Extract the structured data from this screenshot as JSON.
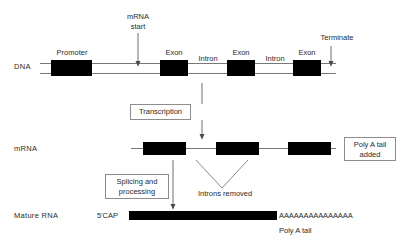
{
  "diagram": {
    "row_labels": {
      "dna": "DNA",
      "mrna": "mRNA",
      "mature_rna": "Mature RNA"
    },
    "dna_features": [
      {
        "label": "Promoter"
      },
      {
        "label": "Exon"
      },
      {
        "label": "Intron"
      },
      {
        "label": "Exon"
      },
      {
        "label": "Intron"
      },
      {
        "label": "Exon"
      }
    ],
    "annotations": {
      "mrna_start": "mRNA\nstart",
      "mrna_start_line1": "mRNA",
      "mrna_start_line2": "start",
      "terminate": "Terminate",
      "introns_removed": "Introns removed",
      "five_prime_cap": "5'CAP",
      "poly_a_sequence": "AAAAAAAAAAAAAAA",
      "poly_a_tail": "Poly A tail"
    },
    "process_boxes": [
      {
        "line1": "Transcription",
        "line2": ""
      },
      {
        "line1": "Splicing and",
        "line2": "processing"
      },
      {
        "line1": "Poly A tail",
        "line2": "added"
      }
    ],
    "colors": {
      "block": "#000000",
      "strand": "#777777",
      "box_border": "#8d8d8d",
      "text": "#2b2b2b",
      "background": "#ffffff"
    }
  }
}
